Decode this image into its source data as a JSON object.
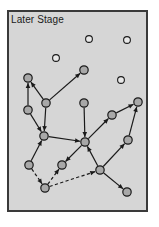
{
  "figure": {
    "title": "Later Stage",
    "panel": {
      "x": 7,
      "y": 10,
      "width": 141,
      "height": 202,
      "fill": "#d6d6d6",
      "border_color": "#3a3a3a",
      "border_width": 2
    },
    "style": {
      "node_fill": "#a8a8a8",
      "node_stroke": "#1a1a1a",
      "node_radius": 4.2,
      "empty_node_fill": "#e8e8e8",
      "empty_node_radius": 3.4,
      "edge_color": "#1a1a1a",
      "edge_width": 1.2,
      "text_color": "#1a1a1a"
    }
  },
  "chart_data": {
    "type": "diagram",
    "title": "Later Stage",
    "nodes": [
      {
        "id": "n1",
        "x": 28,
        "y": 78,
        "state": "filled"
      },
      {
        "id": "n2",
        "x": 28,
        "y": 110,
        "state": "filled"
      },
      {
        "id": "n3",
        "x": 46,
        "y": 103,
        "state": "filled"
      },
      {
        "id": "n4",
        "x": 44,
        "y": 136,
        "state": "filled"
      },
      {
        "id": "n5",
        "x": 84,
        "y": 70,
        "state": "filled"
      },
      {
        "id": "n6",
        "x": 84,
        "y": 103,
        "state": "filled"
      },
      {
        "id": "n7",
        "x": 85,
        "y": 142,
        "state": "filled"
      },
      {
        "id": "n8",
        "x": 112,
        "y": 115,
        "state": "filled"
      },
      {
        "id": "n9",
        "x": 138,
        "y": 102,
        "state": "filled"
      },
      {
        "id": "n10",
        "x": 128,
        "y": 140,
        "state": "filled"
      },
      {
        "id": "n11",
        "x": 29,
        "y": 165,
        "state": "filled"
      },
      {
        "id": "n12",
        "x": 62,
        "y": 165,
        "state": "filled"
      },
      {
        "id": "n13",
        "x": 45,
        "y": 188,
        "state": "filled"
      },
      {
        "id": "n14",
        "x": 100,
        "y": 170,
        "state": "filled"
      },
      {
        "id": "n15",
        "x": 127,
        "y": 192,
        "state": "filled"
      },
      {
        "id": "e1",
        "x": 89,
        "y": 39,
        "state": "empty"
      },
      {
        "id": "e2",
        "x": 127,
        "y": 40,
        "state": "empty"
      },
      {
        "id": "e3",
        "x": 56,
        "y": 58,
        "state": "empty"
      },
      {
        "id": "e4",
        "x": 121,
        "y": 80,
        "state": "empty"
      }
    ],
    "edges": [
      {
        "from": "n2",
        "to": "n1",
        "style": "solid",
        "arrow": true
      },
      {
        "from": "n3",
        "to": "n1",
        "style": "solid",
        "arrow": true
      },
      {
        "from": "n3",
        "to": "n5",
        "style": "solid",
        "arrow": true
      },
      {
        "from": "n3",
        "to": "n4",
        "style": "solid",
        "arrow": true
      },
      {
        "from": "n2",
        "to": "n4",
        "style": "solid",
        "arrow": true
      },
      {
        "from": "n4",
        "to": "n7",
        "style": "solid",
        "arrow": true
      },
      {
        "from": "n11",
        "to": "n4",
        "style": "solid",
        "arrow": true
      },
      {
        "from": "n6",
        "to": "n7",
        "style": "solid",
        "arrow": true
      },
      {
        "from": "n7",
        "to": "n12",
        "style": "solid",
        "arrow": true
      },
      {
        "from": "n14",
        "to": "n7",
        "style": "solid",
        "arrow": true
      },
      {
        "from": "n8",
        "to": "n9",
        "style": "solid",
        "arrow": true
      },
      {
        "from": "n7",
        "to": "n8",
        "style": "solid",
        "arrow": true
      },
      {
        "from": "n10",
        "to": "n9",
        "style": "solid",
        "arrow": true
      },
      {
        "from": "n14",
        "to": "n10",
        "style": "solid",
        "arrow": true
      },
      {
        "from": "n14",
        "to": "n15",
        "style": "solid",
        "arrow": true
      },
      {
        "from": "n11",
        "to": "n13",
        "style": "dashed",
        "arrow": true
      },
      {
        "from": "n13",
        "to": "n12",
        "style": "dashed",
        "arrow": true
      },
      {
        "from": "n13",
        "to": "n14",
        "style": "dashed",
        "arrow": true
      }
    ]
  }
}
